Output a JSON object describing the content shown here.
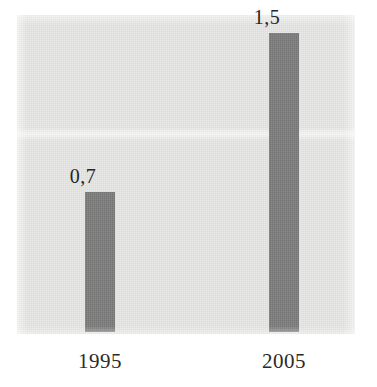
{
  "chart_data": {
    "type": "bar",
    "title": "",
    "subtitle": "",
    "xlabel": "",
    "ylabel": "",
    "categories": [
      "1995",
      "2005"
    ],
    "values": [
      0.7,
      1.5
    ],
    "value_labels": [
      "0,7",
      "1,5"
    ],
    "ylim": [
      0,
      1.59
    ],
    "grid": false,
    "legend": false,
    "legend_position": "none",
    "axis_ticks_visible": false,
    "decimal_separator": ",",
    "bars": [
      {
        "category": "1995",
        "value": 0.7,
        "label": "0,7"
      },
      {
        "category": "2005",
        "value": 1.5,
        "label": "1,5"
      }
    ]
  },
  "colors": {
    "bar_fill": "#7e7e7e",
    "plot_background": "#e9e9e7",
    "figure_background": "#ffffff",
    "label_text": "#262626",
    "category_text": "#2a2a2a"
  }
}
